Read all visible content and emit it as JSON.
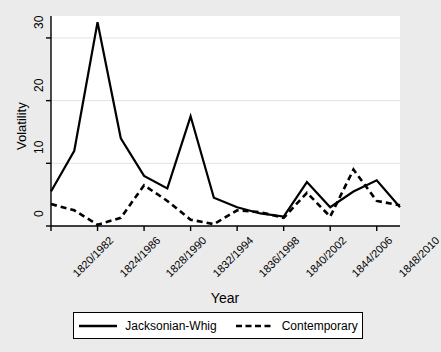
{
  "figure": {
    "background_color": "#ebebeb",
    "plot_background_color": "#ffffff",
    "line_color": "#000000"
  },
  "axis": {
    "ylabel": "Volatility",
    "xlabel": "Year",
    "yticks": [
      "0",
      "10",
      "20",
      "30"
    ],
    "xticks": [
      "1820/1982",
      "1824/1986",
      "1828/1990",
      "1832/1994",
      "1836/1998",
      "1840/2002",
      "1844/2006",
      "1848/2010"
    ]
  },
  "legend": {
    "entries": [
      {
        "label": "Jacksonian-Whig",
        "style": "solid",
        "icon": "solid-line-swatch"
      },
      {
        "label": "Contemporary",
        "style": "dashed",
        "icon": "dashed-line-swatch"
      }
    ]
  },
  "chart_data": {
    "type": "line",
    "title": "",
    "xlabel": "Year",
    "ylabel": "Volatility",
    "ylim": [
      0,
      33.5
    ],
    "yticks": [
      0,
      10,
      20,
      30
    ],
    "grid": true,
    "legend_position": "below",
    "x_tick_labels": [
      "1820/1982",
      "1824/1986",
      "1828/1990",
      "1832/1994",
      "1836/1998",
      "1840/2002",
      "1844/2006",
      "1848/2010"
    ],
    "x_tick_indices": [
      0,
      2,
      4,
      6,
      8,
      10,
      12,
      14
    ],
    "x": [
      0,
      1,
      2,
      3,
      4,
      5,
      6,
      7,
      8,
      9,
      10,
      11,
      12,
      13,
      14,
      15
    ],
    "series": [
      {
        "name": "Jacksonian-Whig",
        "style": "solid",
        "values": [
          5.5,
          12.0,
          32.5,
          14.0,
          8.0,
          6.0,
          17.5,
          4.5,
          3.0,
          2.0,
          1.5,
          7.0,
          3.0,
          5.5,
          7.3,
          3.0
        ]
      },
      {
        "name": "Contemporary",
        "style": "dashed",
        "values": [
          3.5,
          2.5,
          0.2,
          1.3,
          6.5,
          4.0,
          1.0,
          0.3,
          2.5,
          2.2,
          1.3,
          5.3,
          1.5,
          9.0,
          4.0,
          3.3
        ]
      }
    ]
  }
}
